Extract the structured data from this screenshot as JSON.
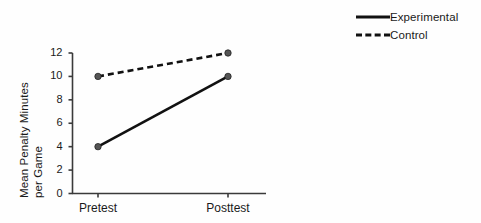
{
  "chart_data": {
    "type": "line",
    "title": "",
    "subtitle": "",
    "xlabel": "",
    "ylabel_line1": "Mean Penalty Minutes",
    "ylabel_line2": "per Game",
    "categories": [
      "Pretest",
      "Posttest"
    ],
    "ylim": [
      0,
      12
    ],
    "yticks": [
      0,
      2,
      4,
      6,
      8,
      10,
      12
    ],
    "ytick_labels": [
      "0",
      "2",
      "4",
      "6",
      "8",
      "10",
      "12"
    ],
    "grid": false,
    "legend_position": "top-right",
    "series": [
      {
        "name": "Experimental",
        "values": [
          4,
          10
        ],
        "linestyle": "solid",
        "color": "#111111",
        "marker": "circle"
      },
      {
        "name": "Control",
        "values": [
          10,
          12
        ],
        "linestyle": "dashed",
        "color": "#111111",
        "marker": "circle"
      }
    ]
  },
  "legend": {
    "items": [
      {
        "label": "Experimental",
        "style": "solid"
      },
      {
        "label": "Control",
        "style": "dashed"
      }
    ]
  },
  "colors": {
    "background": "#fefefe",
    "ink": "#1a1a1a",
    "line": "#111111",
    "axis": "#3a3a3a",
    "marker": "#555555"
  }
}
